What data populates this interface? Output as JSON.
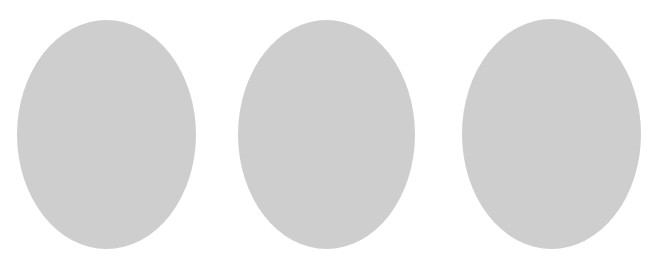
{
  "canvas": {
    "background_color": "#ffffff",
    "width": 655,
    "height": 268
  },
  "shapes": [
    {
      "type": "ellipse",
      "label": "",
      "color": "#cecece"
    },
    {
      "type": "ellipse",
      "label": "",
      "color": "#cecece"
    },
    {
      "type": "ellipse",
      "label": "",
      "color": "#cecece"
    }
  ]
}
